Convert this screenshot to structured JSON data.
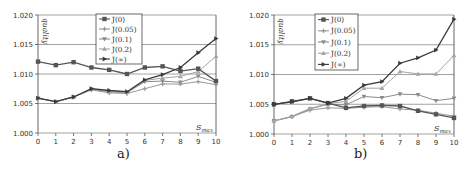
{
  "chart_data": [
    {
      "panel": "a",
      "type": "line",
      "caption": "a)",
      "title": "",
      "xlabel": "S_max",
      "ylabel": "quality",
      "ylim": [
        1.0,
        1.02
      ],
      "xlim": [
        0,
        10
      ],
      "yticks": [
        "1.000",
        "1.005",
        "1.010",
        "1.015",
        "1.020"
      ],
      "xticks": [
        "0",
        "1",
        "2",
        "3",
        "4",
        "5",
        "6",
        "7",
        "8",
        "9",
        "10"
      ],
      "grid": "horizontal",
      "legend_position": "upper-center",
      "x": [
        0,
        1,
        2,
        3,
        4,
        5,
        6,
        7,
        8,
        9,
        10
      ],
      "series": [
        {
          "name": "J(0)",
          "marker": "square",
          "color": "#555555",
          "values": [
            1.0121,
            1.0115,
            1.012,
            1.0111,
            1.0107,
            1.01,
            1.0111,
            1.0113,
            1.0105,
            1.0109,
            1.0088
          ]
        },
        {
          "name": "J(0.05)",
          "marker": "plus",
          "color": "#9a9a9a",
          "values": [
            1.0059,
            1.0053,
            1.0061,
            1.0073,
            1.0068,
            1.0067,
            1.0075,
            1.0083,
            1.0083,
            1.0087,
            1.0082
          ]
        },
        {
          "name": "J(0.1)",
          "marker": "down-triangle",
          "color": "#8c8c8c",
          "values": [
            1.0059,
            1.0053,
            1.0061,
            1.0074,
            1.007,
            1.0068,
            1.0087,
            1.0088,
            1.0086,
            1.0096,
            1.0086
          ]
        },
        {
          "name": "J(0.2)",
          "marker": "triangle",
          "color": "#a5a5a5",
          "values": [
            1.0059,
            1.0053,
            1.0061,
            1.0075,
            1.0071,
            1.0069,
            1.0089,
            1.0093,
            1.0096,
            1.0104,
            1.013
          ]
        },
        {
          "name": "J(∞)",
          "marker": "right-triangle",
          "color": "#3a3a3a",
          "values": [
            1.0059,
            1.0053,
            1.0061,
            1.0075,
            1.0072,
            1.007,
            1.009,
            1.0099,
            1.0111,
            1.0136,
            1.016
          ]
        }
      ]
    },
    {
      "panel": "b",
      "type": "line",
      "caption": "b)",
      "title": "",
      "xlabel": "S_max",
      "ylabel": "quality",
      "ylim": [
        1.0,
        1.02
      ],
      "xlim": [
        0,
        10
      ],
      "yticks": [
        "1.000",
        "1.005",
        "1.010",
        "1.015",
        "1.020"
      ],
      "xticks": [
        "0",
        "1",
        "2",
        "3",
        "4",
        "5",
        "6",
        "7",
        "8",
        "9",
        "10"
      ],
      "grid": "horizontal",
      "legend_position": "upper-left",
      "x": [
        0,
        1,
        2,
        3,
        4,
        5,
        6,
        7,
        8,
        9,
        10
      ],
      "series": [
        {
          "name": "J(0)",
          "marker": "square",
          "color": "#555555",
          "values": [
            1.005,
            1.0055,
            1.006,
            1.0052,
            1.0044,
            1.0047,
            1.0048,
            1.0047,
            1.0039,
            1.0033,
            1.0027
          ]
        },
        {
          "name": "J(0.05)",
          "marker": "plus",
          "color": "#9a9a9a",
          "values": [
            1.0022,
            1.0029,
            1.004,
            1.0044,
            1.0043,
            1.0045,
            1.0046,
            1.0042,
            1.004,
            1.0035,
            1.003
          ]
        },
        {
          "name": "J(0.1)",
          "marker": "down-triangle",
          "color": "#8c8c8c",
          "values": [
            1.0022,
            1.0029,
            1.0042,
            1.005,
            1.0049,
            1.0063,
            1.0061,
            1.0067,
            1.0066,
            1.0056,
            1.006
          ]
        },
        {
          "name": "J(0.2)",
          "marker": "triangle",
          "color": "#a5a5a5",
          "values": [
            1.0022,
            1.003,
            1.0043,
            1.0051,
            1.0055,
            1.0077,
            1.0077,
            1.0105,
            1.0101,
            1.0101,
            1.0132
          ]
        },
        {
          "name": "J(∞)",
          "marker": "right-triangle",
          "color": "#3a3a3a",
          "values": [
            1.005,
            1.0054,
            1.006,
            1.0052,
            1.006,
            1.0082,
            1.0088,
            1.0119,
            1.0128,
            1.0141,
            1.0193
          ]
        }
      ]
    }
  ],
  "panels": {
    "a": {
      "caption": "a)",
      "ylabel": "quality",
      "xlabel_main": "S",
      "xlabel_sub": "max"
    },
    "b": {
      "caption": "b)",
      "ylabel": "quality",
      "xlabel_main": "S",
      "xlabel_sub": "max"
    }
  }
}
